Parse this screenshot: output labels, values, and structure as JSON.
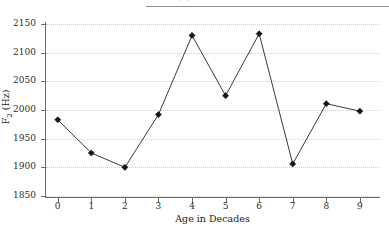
{
  "caption": {
    "cutoff_text": "y  g"
  },
  "chart_data": {
    "type": "line",
    "title": "",
    "xlabel": "Age in Decades",
    "ylabel": "F2 (Hz)",
    "ylabel_base": "F",
    "ylabel_sub": "2",
    "ylabel_unit": " (Hz)",
    "x": [
      0,
      1,
      2,
      3,
      4,
      5,
      6,
      7,
      8,
      9
    ],
    "values": [
      1983,
      1925,
      1900,
      1992,
      2130,
      2025,
      2133,
      1906,
      2011,
      1998
    ],
    "xticklabels": [
      "0",
      "1",
      "2",
      "3",
      "4",
      "5",
      "6",
      "7",
      "8",
      "9"
    ],
    "yticklabels": [
      "1850",
      "1900",
      "1950",
      "2000",
      "2050",
      "2100",
      "2150"
    ],
    "yticks": [
      1850,
      1900,
      1950,
      2000,
      2050,
      2100,
      2150
    ],
    "xlim": [
      -0.35,
      9.6
    ],
    "ylim": [
      1850,
      2150
    ],
    "grid": "horizontal-dotted",
    "legend": "none",
    "marker": "diamond",
    "line_color": "#3a3a3a",
    "marker_color": "#141414",
    "grid_color": "#cfcfcf",
    "axis_color": "#6b6b6b"
  }
}
